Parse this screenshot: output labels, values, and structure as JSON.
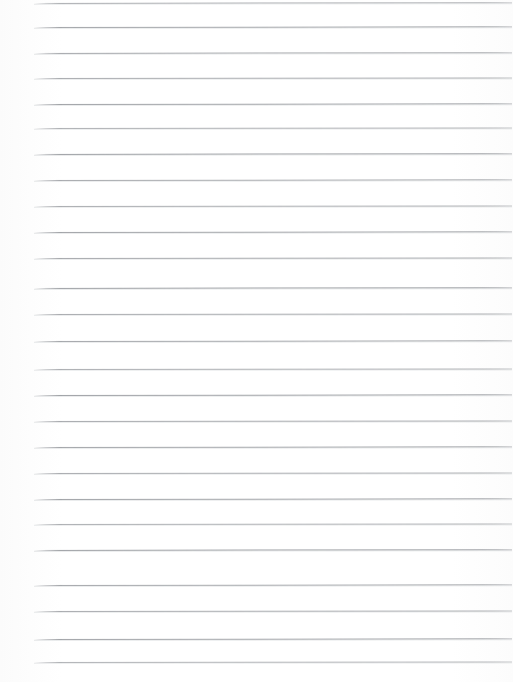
{
  "document": {
    "kind": "scanned-lined-paper",
    "title": "Blank ruled notebook page",
    "visible_text": "",
    "page_width": 513,
    "page_height": 682,
    "background_color": "#fefefe",
    "line_color": "#8e9196",
    "line_thickness_px": 1,
    "line_count": 26,
    "line_start_x": 34,
    "line_end_x": 512,
    "line_spacing_px": 25.8,
    "first_line_y": 3,
    "lines": [
      {
        "index": 1,
        "y": 3,
        "x1": 34,
        "x2": 512,
        "opacity": 0.72,
        "tilt": -0.1
      },
      {
        "index": 2,
        "y": 27,
        "x1": 34,
        "x2": 512,
        "opacity": 0.8,
        "tilt": -0.08
      },
      {
        "index": 3,
        "y": 53,
        "x1": 34,
        "x2": 512,
        "opacity": 0.78,
        "tilt": -0.1
      },
      {
        "index": 4,
        "y": 78,
        "x1": 34,
        "x2": 512,
        "opacity": 0.74,
        "tilt": -0.06
      },
      {
        "index": 5,
        "y": 104,
        "x1": 34,
        "x2": 512,
        "opacity": 0.82,
        "tilt": -0.09
      },
      {
        "index": 6,
        "y": 128,
        "x1": 34,
        "x2": 512,
        "opacity": 0.7,
        "tilt": -0.07
      },
      {
        "index": 7,
        "y": 154,
        "x1": 34,
        "x2": 512,
        "opacity": 0.85,
        "tilt": -0.1
      },
      {
        "index": 8,
        "y": 180,
        "x1": 34,
        "x2": 512,
        "opacity": 0.76,
        "tilt": -0.08
      },
      {
        "index": 9,
        "y": 206,
        "x1": 34,
        "x2": 512,
        "opacity": 0.73,
        "tilt": -0.05
      },
      {
        "index": 10,
        "y": 232,
        "x1": 34,
        "x2": 512,
        "opacity": 0.81,
        "tilt": -0.09
      },
      {
        "index": 11,
        "y": 258,
        "x1": 34,
        "x2": 512,
        "opacity": 0.77,
        "tilt": -0.07
      },
      {
        "index": 12,
        "y": 288,
        "x1": 34,
        "x2": 512,
        "opacity": 0.84,
        "tilt": -0.1
      },
      {
        "index": 13,
        "y": 314,
        "x1": 34,
        "x2": 512,
        "opacity": 0.75,
        "tilt": -0.06
      },
      {
        "index": 14,
        "y": 341,
        "x1": 34,
        "x2": 512,
        "opacity": 0.79,
        "tilt": -0.08
      },
      {
        "index": 15,
        "y": 369,
        "x1": 34,
        "x2": 512,
        "opacity": 0.72,
        "tilt": -0.05
      },
      {
        "index": 16,
        "y": 395,
        "x1": 34,
        "x2": 512,
        "opacity": 0.83,
        "tilt": -0.09
      },
      {
        "index": 17,
        "y": 421,
        "x1": 34,
        "x2": 512,
        "opacity": 0.76,
        "tilt": -0.07
      },
      {
        "index": 18,
        "y": 447,
        "x1": 34,
        "x2": 512,
        "opacity": 0.8,
        "tilt": -0.08
      },
      {
        "index": 19,
        "y": 473,
        "x1": 34,
        "x2": 512,
        "opacity": 0.74,
        "tilt": -0.06
      },
      {
        "index": 20,
        "y": 499,
        "x1": 34,
        "x2": 512,
        "opacity": 0.82,
        "tilt": -0.09
      },
      {
        "index": 21,
        "y": 524,
        "x1": 34,
        "x2": 512,
        "opacity": 0.71,
        "tilt": -0.05
      },
      {
        "index": 22,
        "y": 550,
        "x1": 34,
        "x2": 512,
        "opacity": 0.85,
        "tilt": -0.1
      },
      {
        "index": 23,
        "y": 585,
        "x1": 34,
        "x2": 512,
        "opacity": 0.78,
        "tilt": -0.08
      },
      {
        "index": 24,
        "y": 611,
        "x1": 34,
        "x2": 512,
        "opacity": 0.75,
        "tilt": -0.06
      },
      {
        "index": 25,
        "y": 639,
        "x1": 34,
        "x2": 512,
        "opacity": 0.81,
        "tilt": -0.09
      },
      {
        "index": 26,
        "y": 662,
        "x1": 34,
        "x2": 512,
        "opacity": 0.68,
        "tilt": -0.07
      }
    ]
  }
}
